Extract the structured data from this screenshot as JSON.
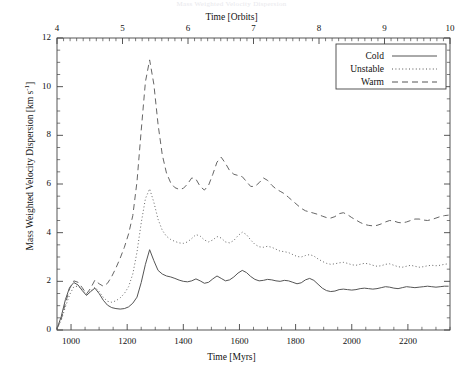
{
  "page": {
    "faint_header": "Mass Weighted Velocity Dispersion"
  },
  "chart_data": {
    "type": "line",
    "title": "",
    "xlabel": "Time [Myrs]",
    "xlabel_top": "Time [Orbits]",
    "ylabel": "Mass Weighted Velocity Dispersion [km s",
    "ylabel_exponent": "-1",
    "ylabel_suffix": "]",
    "xlim": [
      950,
      2350
    ],
    "ylim": [
      0,
      12
    ],
    "xlim_top": [
      4,
      10
    ],
    "grid": false,
    "legend_position": "top-right",
    "xticks": [
      1000,
      1200,
      1400,
      1600,
      1800,
      2000,
      2200
    ],
    "xticklabels": [
      "1000",
      "1200",
      "1400",
      "1600",
      "1800",
      "2000",
      "2200"
    ],
    "xticks_top": [
      4,
      5,
      6,
      7,
      8,
      9,
      10
    ],
    "xticklabels_top": [
      "4",
      "5",
      "6",
      "7",
      "8",
      "9",
      "10"
    ],
    "yticks": [
      0,
      2,
      4,
      6,
      8,
      10,
      12
    ],
    "yticklabels": [
      "0",
      "2",
      "4",
      "6",
      "8",
      "10",
      "12"
    ],
    "x": [
      950,
      965,
      980,
      995,
      1010,
      1025,
      1040,
      1055,
      1070,
      1085,
      1100,
      1115,
      1130,
      1145,
      1160,
      1175,
      1190,
      1205,
      1220,
      1235,
      1250,
      1265,
      1280,
      1295,
      1310,
      1325,
      1340,
      1355,
      1370,
      1385,
      1400,
      1415,
      1430,
      1445,
      1460,
      1475,
      1490,
      1505,
      1520,
      1535,
      1550,
      1565,
      1580,
      1595,
      1610,
      1625,
      1640,
      1655,
      1670,
      1685,
      1700,
      1715,
      1730,
      1745,
      1760,
      1775,
      1790,
      1805,
      1820,
      1835,
      1850,
      1865,
      1880,
      1895,
      1910,
      1925,
      1940,
      1955,
      1970,
      1985,
      2000,
      2015,
      2030,
      2045,
      2060,
      2075,
      2090,
      2105,
      2120,
      2135,
      2150,
      2165,
      2180,
      2195,
      2210,
      2225,
      2240,
      2255,
      2270,
      2285,
      2300,
      2315,
      2330,
      2345
    ],
    "series": [
      {
        "name": "Cold",
        "style": "solid",
        "color": "#555555",
        "values": [
          0.05,
          0.55,
          1.25,
          1.75,
          1.95,
          1.85,
          1.62,
          1.42,
          1.58,
          1.72,
          1.5,
          1.22,
          1.02,
          0.92,
          0.88,
          0.86,
          0.88,
          0.95,
          1.1,
          1.35,
          1.95,
          2.7,
          3.3,
          2.85,
          2.45,
          2.3,
          2.22,
          2.18,
          2.12,
          2.05,
          2.0,
          1.98,
          2.02,
          2.1,
          2.02,
          1.92,
          1.96,
          2.1,
          2.22,
          2.12,
          2.02,
          2.06,
          2.18,
          2.34,
          2.45,
          2.36,
          2.2,
          2.08,
          2.02,
          2.04,
          2.08,
          2.06,
          2.02,
          2.0,
          2.04,
          2.02,
          1.96,
          1.9,
          1.94,
          2.06,
          2.12,
          2.04,
          1.88,
          1.72,
          1.62,
          1.58,
          1.6,
          1.66,
          1.68,
          1.66,
          1.64,
          1.66,
          1.7,
          1.72,
          1.7,
          1.68,
          1.7,
          1.74,
          1.78,
          1.76,
          1.72,
          1.7,
          1.74,
          1.78,
          1.76,
          1.74,
          1.76,
          1.78,
          1.8,
          1.78,
          1.76,
          1.78,
          1.8,
          1.8
        ]
      },
      {
        "name": "Unstable",
        "style": "dotted",
        "color": "#666666",
        "values": [
          0.05,
          0.4,
          0.95,
          1.45,
          1.78,
          1.8,
          1.66,
          1.46,
          1.6,
          1.76,
          1.58,
          1.34,
          1.18,
          1.14,
          1.2,
          1.32,
          1.5,
          1.78,
          2.3,
          3.2,
          4.4,
          5.4,
          5.8,
          5.25,
          4.55,
          4.1,
          3.85,
          3.72,
          3.64,
          3.58,
          3.56,
          3.62,
          3.76,
          3.92,
          3.86,
          3.7,
          3.62,
          3.7,
          3.84,
          3.78,
          3.62,
          3.58,
          3.68,
          3.88,
          4.02,
          3.92,
          3.7,
          3.52,
          3.42,
          3.4,
          3.44,
          3.4,
          3.32,
          3.24,
          3.22,
          3.18,
          3.1,
          3.02,
          3.0,
          3.06,
          3.1,
          3.04,
          2.92,
          2.82,
          2.74,
          2.7,
          2.72,
          2.76,
          2.78,
          2.74,
          2.68,
          2.66,
          2.7,
          2.74,
          2.72,
          2.66,
          2.62,
          2.64,
          2.7,
          2.72,
          2.66,
          2.6,
          2.58,
          2.62,
          2.66,
          2.62,
          2.58,
          2.6,
          2.64,
          2.66,
          2.64,
          2.66,
          2.7,
          2.72
        ]
      },
      {
        "name": "Warm",
        "style": "dashed",
        "color": "#666666",
        "values": [
          0.05,
          0.45,
          1.1,
          1.7,
          2.02,
          1.96,
          1.74,
          1.48,
          1.72,
          2.05,
          1.9,
          1.8,
          1.92,
          2.2,
          2.55,
          2.95,
          3.4,
          3.95,
          4.7,
          6.1,
          8.2,
          10.2,
          11.1,
          10.1,
          8.45,
          7.2,
          6.45,
          6.05,
          5.85,
          5.78,
          5.82,
          6.0,
          6.25,
          6.2,
          5.9,
          5.75,
          5.95,
          6.4,
          6.9,
          7.1,
          6.85,
          6.55,
          6.4,
          6.35,
          6.3,
          6.1,
          5.9,
          5.9,
          6.05,
          6.25,
          6.15,
          5.95,
          5.8,
          5.7,
          5.6,
          5.45,
          5.3,
          5.15,
          5.0,
          4.9,
          4.85,
          4.8,
          4.75,
          4.68,
          4.62,
          4.6,
          4.66,
          4.78,
          4.82,
          4.74,
          4.62,
          4.52,
          4.42,
          4.34,
          4.3,
          4.28,
          4.3,
          4.36,
          4.44,
          4.5,
          4.48,
          4.42,
          4.4,
          4.44,
          4.5,
          4.56,
          4.56,
          4.52,
          4.5,
          4.54,
          4.6,
          4.66,
          4.7,
          4.72
        ]
      }
    ],
    "legend": [
      {
        "label": "Cold",
        "style": "solid"
      },
      {
        "label": "Unstable",
        "style": "dotted"
      },
      {
        "label": "Warm",
        "style": "dashed"
      }
    ]
  }
}
